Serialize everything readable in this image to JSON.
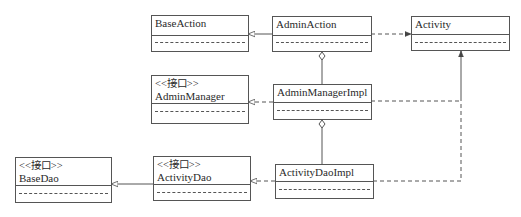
{
  "diagram": {
    "type": "uml-class-diagram",
    "colors": {
      "stroke": "#555555",
      "text": "#2a2a2a",
      "background": "#ffffff"
    },
    "classes": [
      {
        "id": "BaseAction",
        "stereotype": "",
        "name": "BaseAction"
      },
      {
        "id": "AdminAction",
        "stereotype": "",
        "name": "AdminAction"
      },
      {
        "id": "Activity",
        "stereotype": "",
        "name": "Activity"
      },
      {
        "id": "AdminManager",
        "stereotype": "<<接口>>",
        "name": "AdminManager"
      },
      {
        "id": "AdminManagerImpl",
        "stereotype": "",
        "name": "AdminManagerImpl"
      },
      {
        "id": "BaseDao",
        "stereotype": "<<接口>>",
        "name": "BaseDao"
      },
      {
        "id": "ActivityDao",
        "stereotype": "<<接口>>",
        "name": "ActivityDao"
      },
      {
        "id": "ActivityDaoImpl",
        "stereotype": "",
        "name": "ActivityDaoImpl"
      }
    ],
    "relations": [
      {
        "from": "AdminAction",
        "to": "BaseAction",
        "kind": "generalization"
      },
      {
        "from": "AdminAction",
        "to": "Activity",
        "kind": "dependency"
      },
      {
        "from": "AdminAction",
        "to": "AdminManagerImpl",
        "kind": "aggregation"
      },
      {
        "from": "AdminManagerImpl",
        "to": "AdminManager",
        "kind": "realization"
      },
      {
        "from": "AdminManagerImpl",
        "to": "Activity",
        "kind": "dependency"
      },
      {
        "from": "AdminManagerImpl",
        "to": "ActivityDaoImpl",
        "kind": "aggregation"
      },
      {
        "from": "ActivityDaoImpl",
        "to": "ActivityDao",
        "kind": "realization"
      },
      {
        "from": "ActivityDaoImpl",
        "to": "Activity",
        "kind": "dependency"
      },
      {
        "from": "ActivityDao",
        "to": "BaseDao",
        "kind": "generalization"
      }
    ]
  }
}
